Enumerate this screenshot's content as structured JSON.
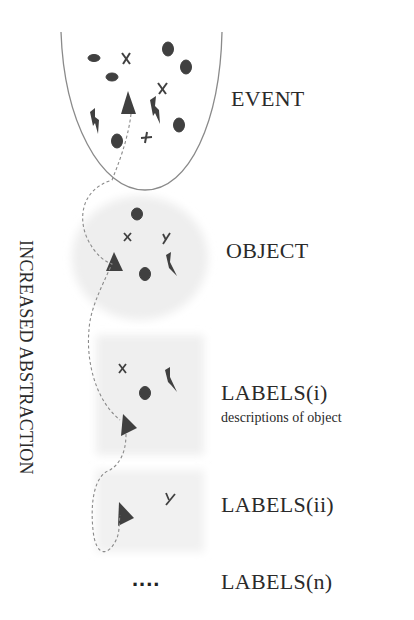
{
  "diagram": {
    "side_label": "INCREASED ABSTRACTION",
    "levels": [
      {
        "id": "event",
        "label": "EVENT"
      },
      {
        "id": "object",
        "label": "OBJECT"
      },
      {
        "id": "labels_i",
        "label": "LABELS(i)",
        "sublabel": "descriptions of object"
      },
      {
        "id": "labels_ii",
        "label": "LABELS(ii)"
      },
      {
        "id": "labels_n",
        "label": "LABELS(n)",
        "marker": "...."
      }
    ],
    "shapes_legend": [
      "ellipse",
      "oval",
      "cross-x",
      "cross-plus",
      "triangle",
      "lightning",
      "y-fork"
    ],
    "colors": {
      "shape_fill": "#404040",
      "outline": "#8a8a8a",
      "shaded_box": "#f0f0f0",
      "text": "#2a2a2a"
    }
  }
}
